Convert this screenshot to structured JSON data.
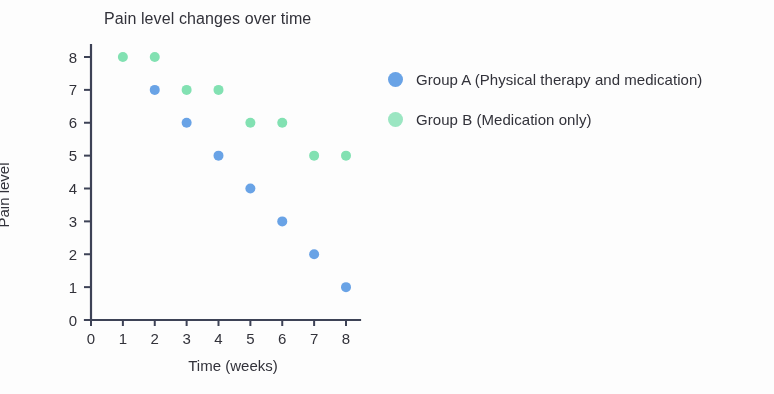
{
  "chart_data": {
    "type": "scatter",
    "title": "Pain level changes over time",
    "xlabel": "Time (weeks)",
    "ylabel": "Pain level",
    "xlim": [
      0,
      8
    ],
    "ylim": [
      0,
      8
    ],
    "xticks": [
      "0",
      "1",
      "2",
      "3",
      "4",
      "5",
      "6",
      "7",
      "8"
    ],
    "yticks": [
      "0",
      "1",
      "2",
      "3",
      "4",
      "5",
      "6",
      "7",
      "8"
    ],
    "grid": false,
    "legend_position": "right",
    "series": [
      {
        "name": "Group A (Physical therapy and medication)",
        "short_name": "Group A",
        "color": "#6aa4e8",
        "x": [
          2,
          3,
          4,
          5,
          6,
          7,
          8
        ],
        "values": [
          7,
          6,
          5,
          4,
          3,
          2,
          1
        ]
      },
      {
        "name": "Group B (Medication only)",
        "short_name": "Group B",
        "color": "#83e3b4",
        "x": [
          1,
          2,
          3,
          4,
          5,
          6,
          7,
          8
        ],
        "values": [
          8,
          8,
          7,
          7,
          6,
          6,
          5,
          5
        ]
      }
    ]
  },
  "legend": {
    "items": [
      {
        "label": "Group A (Physical therapy and medication)",
        "color": "#6aa4e8"
      },
      {
        "label": "Group B (Medication only)",
        "color": "#9ce8c4"
      }
    ]
  },
  "colors": {
    "group_a": "#6aa4e8",
    "group_b": "#83e3b4",
    "axis": "#3d4257",
    "text": "#32323a",
    "background": "#ffffff"
  }
}
